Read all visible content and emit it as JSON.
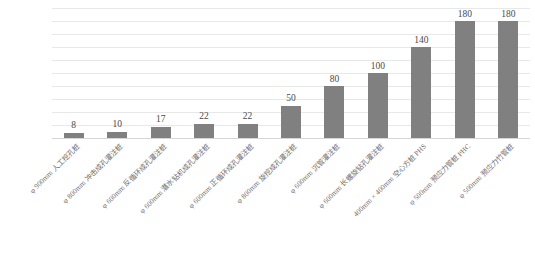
{
  "chart_data": {
    "type": "bar",
    "title": "",
    "subtitle": "",
    "xlabel": "",
    "ylabel": "",
    "ylim": [
      0,
      200
    ],
    "grid": true,
    "gridline_count": 10,
    "legend": "none",
    "bar_color": "#808080",
    "gridline_color": "#e8e8e8",
    "label_color": "#6e6e6e",
    "categories": [
      "φ 900mm 人工挖孔桩",
      "φ 800mm 冲击成孔灌注桩",
      "φ 600mm 反循环成孔灌注桩",
      "φ 600mm 潜水钻机成孔灌注桩",
      "φ 600mm 正循环成孔灌注桩",
      "φ 800mm 旋挖成孔灌注桩",
      "φ 600mm 沉管灌注桩",
      "φ 600mm 长螺旋钻孔灌注桩",
      "400mm × 400mm 空心方桩 PHS",
      "φ 500mm 预应力管桩 PHC",
      "φ 500mm 预应力竹管桩"
    ],
    "values": [
      8,
      10,
      17,
      22,
      22,
      50,
      80,
      100,
      140,
      180,
      180
    ],
    "value_labels": [
      "8",
      "10",
      "17",
      "22",
      "22",
      "50",
      "80",
      "100",
      "140",
      "180",
      "180"
    ]
  },
  "caption": {
    "text": ""
  }
}
